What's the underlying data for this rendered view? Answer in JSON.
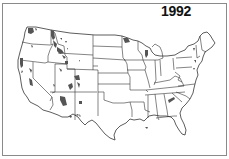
{
  "map": {
    "title": "1992",
    "region": "Contiguous United States",
    "shading_color": "#555555",
    "border_color": "#333333",
    "frame_color": "#8a8a8a",
    "shaded_states": [
      "Washington",
      "Oregon",
      "California",
      "Idaho",
      "Montana",
      "Wyoming",
      "Nevada",
      "Utah",
      "Colorado",
      "Arizona",
      "New Mexico",
      "Minnesota",
      "Wisconsin",
      "Michigan",
      "New York",
      "Tennessee",
      "North Carolina",
      "Louisiana"
    ]
  }
}
